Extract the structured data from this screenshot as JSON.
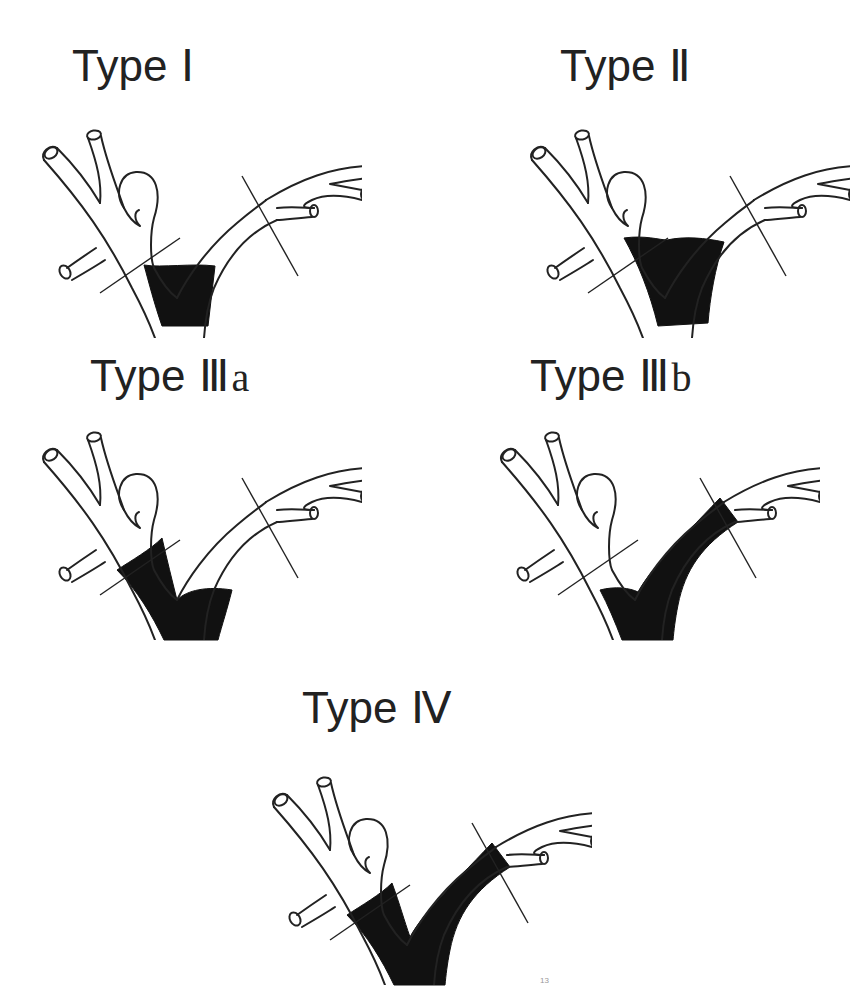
{
  "figure": {
    "panels": [
      {
        "id": "type-1",
        "label": "Type",
        "roman": "Ⅰ",
        "suffix": "",
        "involvement": "common-hepatic-duct-below-confluence"
      },
      {
        "id": "type-2",
        "label": "Type",
        "roman": "Ⅱ",
        "suffix": "",
        "involvement": "confluence"
      },
      {
        "id": "type-3a",
        "label": "Type",
        "roman": "Ⅲ",
        "suffix": "a",
        "involvement": "confluence-plus-right-hepatic-duct"
      },
      {
        "id": "type-3b",
        "label": "Type",
        "roman": "Ⅲ",
        "suffix": "b",
        "involvement": "confluence-plus-left-hepatic-duct"
      },
      {
        "id": "type-4",
        "label": "Type",
        "roman": "Ⅳ",
        "suffix": "",
        "involvement": "confluence-plus-both-hepatic-ducts"
      }
    ],
    "caption_superscript": "13"
  },
  "colors": {
    "background": "#ffffff",
    "outline": "#222222",
    "tumor_fill": "#111111"
  }
}
